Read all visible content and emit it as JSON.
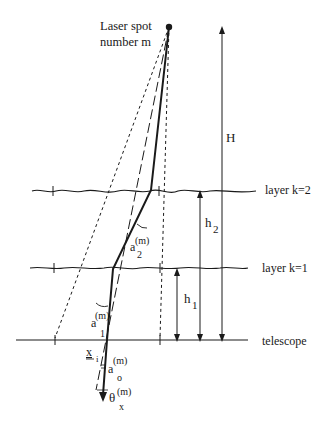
{
  "diagram": {
    "laser_spot_label_line1": "Laser spot",
    "laser_spot_label_line2": "number m",
    "height_label": "H",
    "layers": [
      {
        "label": "layer k=2"
      },
      {
        "label": "layer k=1"
      },
      {
        "label": "telescope"
      }
    ],
    "h2": {
      "base": "h",
      "sub": "2"
    },
    "h1": {
      "base": "h",
      "sub": "1"
    },
    "a2": {
      "base": "a",
      "sup": "(m)",
      "sub": "2"
    },
    "a1": {
      "base": "a",
      "sup": "(m)",
      "sub": "1"
    },
    "a0": {
      "base": "a",
      "sup": "(m)",
      "sub": "o"
    },
    "xi": {
      "base": "x",
      "sub": "i"
    },
    "theta": {
      "base": "θ",
      "sup": "(m)",
      "sub": "x"
    }
  }
}
